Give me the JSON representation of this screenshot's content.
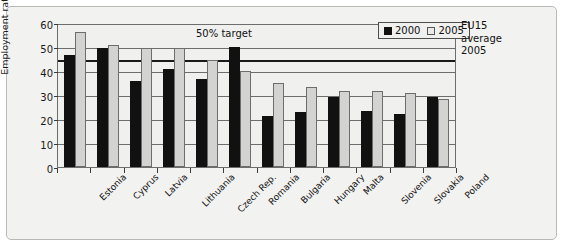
{
  "chart_data": {
    "type": "bar",
    "title": "",
    "xlabel": "",
    "ylabel": "Employment rate %",
    "ylim": [
      0,
      60
    ],
    "yticks": [
      0,
      10,
      20,
      30,
      40,
      50,
      60
    ],
    "grid": true,
    "legend_position": "top-right",
    "categories": [
      "Estonia",
      "Cyprus",
      "Latvia",
      "Lithuania",
      "Czech Rep.",
      "Romania",
      "Bulgaria",
      "Hungary",
      "Malta",
      "Slovenia",
      "Slovakia",
      "Poland"
    ],
    "series": [
      {
        "name": "2000",
        "color": "#111111",
        "values": [
          46.5,
          49.5,
          36.0,
          40.8,
          36.6,
          50.0,
          21.4,
          22.8,
          29.2,
          23.5,
          22.0,
          29.3
        ]
      },
      {
        "name": "2005",
        "color": "#d3d3d1",
        "values": [
          56.1,
          50.7,
          49.5,
          49.4,
          44.5,
          39.8,
          35.2,
          33.5,
          31.5,
          31.5,
          30.9,
          28.2
        ]
      }
    ],
    "reference_lines": [
      {
        "name": "50% target",
        "value": 50,
        "label": "50% target",
        "style": "gridline"
      },
      {
        "name": "EU15 average 2005",
        "value": 44.8,
        "label": "EU15 average 2005",
        "style": "thick"
      }
    ],
    "annotations": {
      "target_label": "50% target",
      "eu_label_line1": "EU15",
      "eu_label_line2": "average",
      "eu_label_line3": "2005"
    }
  },
  "legend": {
    "entries": [
      {
        "label": "2000"
      },
      {
        "label": "2005"
      }
    ]
  }
}
